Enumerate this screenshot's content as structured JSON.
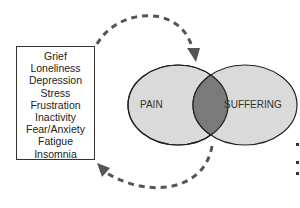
{
  "list": {
    "items": [
      "Grief",
      "Loneliness",
      "Depression",
      "Stress",
      "Frustration",
      "Inactivity",
      "Fear/Anxiety",
      "Fatigue",
      "Insomnia"
    ]
  },
  "venn": {
    "left_label": "PAIN",
    "right_label": "SUFFERING",
    "colors": {
      "circle_fill": "#d9d9d9",
      "overlap_fill": "#7a7a7a",
      "stroke": "#222222",
      "arrow": "#555555"
    }
  }
}
